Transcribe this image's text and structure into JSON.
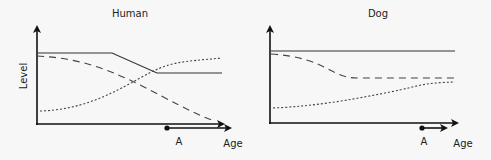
{
  "panels": [
    {
      "title": "Human",
      "ylabel": "Level",
      "xlabel": "Age",
      "marker_label": "A",
      "series": [
        {
          "style": "solid",
          "points": [
            [
              37,
              53
            ],
            [
              112,
              53
            ],
            [
              157,
              73
            ],
            [
              222,
              73
            ]
          ]
        },
        {
          "style": "dashed",
          "points": [
            [
              37,
              56
            ],
            [
              80,
              60
            ],
            [
              130,
              80
            ],
            [
              180,
              105
            ],
            [
              212,
              120
            ]
          ]
        },
        {
          "style": "dotted",
          "points": [
            [
              40,
              111
            ],
            [
              70,
              106
            ],
            [
              110,
              90
            ],
            [
              150,
              70
            ],
            [
              175,
              62
            ],
            [
              222,
              58
            ]
          ]
        }
      ]
    },
    {
      "title": "Dog",
      "ylabel": "",
      "xlabel": "Age",
      "marker_label": "A",
      "series": [
        {
          "style": "solid",
          "points": [
            [
              271,
              51
            ],
            [
              455,
              51
            ]
          ]
        },
        {
          "style": "dashed",
          "points": [
            [
              271,
              54
            ],
            [
              315,
              60
            ],
            [
              345,
              76
            ],
            [
              360,
              78
            ],
            [
              455,
              78
            ]
          ]
        },
        {
          "style": "dotted",
          "points": [
            [
              273,
              108
            ],
            [
              320,
              103
            ],
            [
              380,
              92
            ],
            [
              410,
              85
            ],
            [
              455,
              82
            ]
          ]
        }
      ]
    }
  ],
  "colors": {
    "line": "#333333",
    "axis": "#111111",
    "background": "#f7f7f7"
  }
}
